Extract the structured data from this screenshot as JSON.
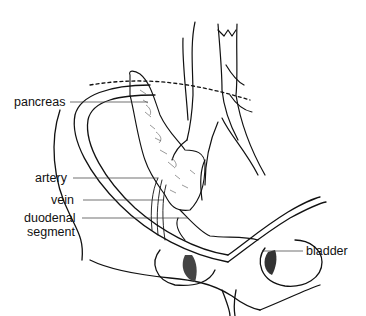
{
  "figure": {
    "labels": {
      "pancreas": "pancreas",
      "artery": "artery",
      "vein": "vein",
      "duodenal_line1": "duodenal",
      "duodenal_line2": "segment",
      "bladder": "bladder"
    }
  }
}
